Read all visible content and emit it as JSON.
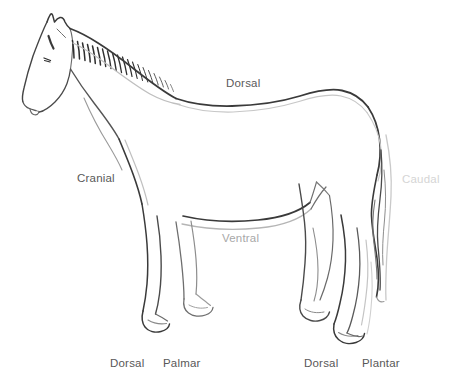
{
  "figure": {
    "background_color": "#ffffff",
    "width": 457,
    "height": 382
  },
  "labels": {
    "dorsal_top": "Dorsal",
    "cranial": "Cranial",
    "caudal": "Caudal",
    "ventral": "Ventral",
    "dorsal_forelimb": "Dorsal",
    "palmar": "Palmar",
    "dorsal_hindlimb": "Dorsal",
    "plantar": "Plantar"
  },
  "label_colors": {
    "dorsal_top": "#5a5a5a",
    "cranial": "#585858",
    "caudal": "#d5d5d5",
    "ventral": "#a8a8a8",
    "dorsal_forelimb": "#585858",
    "palmar": "#585858",
    "dorsal_hindlimb": "#585858",
    "plantar": "#585858"
  },
  "drawing": {
    "subject": "horse-outline",
    "style": "line-drawing",
    "stroke_dark": "#3a3a3a",
    "stroke_mid": "#6e6e6e",
    "stroke_light": "#bcbcbc",
    "parts": [
      "head",
      "ears",
      "eye",
      "muzzle",
      "mane",
      "neck",
      "back",
      "croup",
      "tail",
      "chest",
      "belly",
      "foreleg-near",
      "foreleg-far",
      "hindleg-near",
      "hindleg-far",
      "hooves"
    ]
  }
}
